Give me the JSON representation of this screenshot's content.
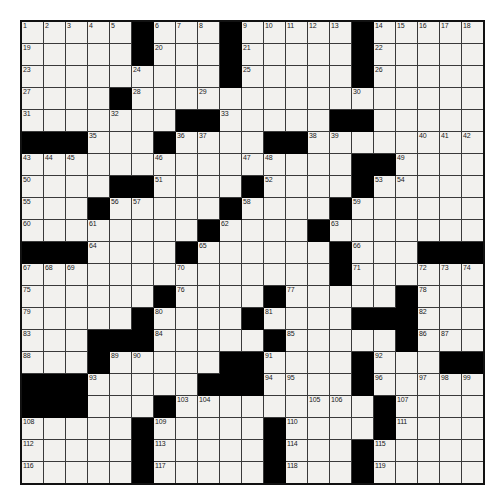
{
  "puzzle": {
    "type": "crossword-grid",
    "rows": 21,
    "cols": 21,
    "colors": {
      "background": "#ffffff",
      "cell_fill": "#f2f1ee",
      "block_fill": "#000000",
      "grid_line": "#3a3a3a",
      "border": "#111111",
      "number_text": "#1a1a1a"
    },
    "max_clue_number": 119,
    "grid": [
      "OOOOO.OOO.OOOOO.OOOOO",
      "OOOOO.OOO.OOOOO.OOOOO",
      "OOOOOOOOO.OOOOO.OOOOO",
      "OOOO.OOOOOOOOOOOOOOOO",
      "OOOOOOO..OOOOO..OOOOO",
      "...OOO.OOOO..OOOOOOOO",
      "OOOOOOOOOOOOOOO..OOOO",
      "OOOO..OOOO.OOOO.OOOOO",
      "OOO.OOOOO.OOOO.OOOOOO",
      "OOOOOOOO.OOOO.OOOOOOO",
      "...OOOO.OOOOOO.OOO...",
      "OOOOOOOOOOOOOO.OOOOOO",
      "OOOOOO.OOOO.OOOOO.OOO",
      "OOOOO.OOOO.OOOO...OOO",
      "OOO...OOOOO.OOOOO.OOO",
      "OOO.OOOOO..OOOO.OOO..",
      "...OOOOO...OOOO.OOOOO",
      "...OOO.OOOOOOOOO.OOOO",
      "OOOOO.OOOOO.OOOO.OOOO",
      "OOOOO.OOOOO.OOO.OOOOO",
      "OOOOO.OOOOO.OOO.OOOOO"
    ],
    "numbers": {
      "r0": [
        {
          "col": 0,
          "n": "1"
        },
        {
          "col": 1,
          "n": "2"
        },
        {
          "col": 2,
          "n": "3"
        },
        {
          "col": 3,
          "n": "4"
        },
        {
          "col": 4,
          "n": "5"
        },
        {
          "col": 6,
          "n": "6"
        },
        {
          "col": 7,
          "n": "7"
        },
        {
          "col": 8,
          "n": "8"
        },
        {
          "col": 10,
          "n": "9"
        },
        {
          "col": 11,
          "n": "10"
        },
        {
          "col": 12,
          "n": "11"
        },
        {
          "col": 13,
          "n": "12"
        },
        {
          "col": 14,
          "n": "13"
        },
        {
          "col": 16,
          "n": "14"
        },
        {
          "col": 17,
          "n": "15"
        },
        {
          "col": 18,
          "n": "16"
        },
        {
          "col": 19,
          "n": "17"
        },
        {
          "col": 20,
          "n": "18"
        }
      ],
      "r1": [
        {
          "col": 0,
          "n": "19"
        },
        {
          "col": 6,
          "n": "20"
        },
        {
          "col": 10,
          "n": "21"
        },
        {
          "col": 16,
          "n": "22"
        }
      ],
      "r2": [
        {
          "col": 0,
          "n": "23"
        },
        {
          "col": 5,
          "n": "24"
        },
        {
          "col": 10,
          "n": "25"
        },
        {
          "col": 16,
          "n": "26"
        }
      ],
      "r3": [
        {
          "col": 0,
          "n": "27"
        },
        {
          "col": 5,
          "n": "28"
        },
        {
          "col": 8,
          "n": "29"
        },
        {
          "col": 15,
          "n": "30"
        }
      ],
      "r4": [
        {
          "col": 0,
          "n": "31"
        },
        {
          "col": 4,
          "n": "32"
        },
        {
          "col": 9,
          "n": "33"
        },
        {
          "col": 15,
          "n": "34"
        }
      ],
      "r5": [
        {
          "col": 3,
          "n": "35"
        },
        {
          "col": 7,
          "n": "36"
        },
        {
          "col": 8,
          "n": "37"
        },
        {
          "col": 13,
          "n": "38"
        },
        {
          "col": 14,
          "n": "39"
        },
        {
          "col": 18,
          "n": "40"
        },
        {
          "col": 19,
          "n": "41"
        },
        {
          "col": 20,
          "n": "42"
        }
      ],
      "r6": [
        {
          "col": 0,
          "n": "43"
        },
        {
          "col": 1,
          "n": "44"
        },
        {
          "col": 2,
          "n": "45"
        },
        {
          "col": 6,
          "n": "46"
        },
        {
          "col": 10,
          "n": "47"
        },
        {
          "col": 11,
          "n": "48"
        },
        {
          "col": 17,
          "n": "49"
        }
      ],
      "r7": [
        {
          "col": 0,
          "n": "50"
        },
        {
          "col": 6,
          "n": "51"
        },
        {
          "col": 11,
          "n": "52"
        },
        {
          "col": 16,
          "n": "53"
        },
        {
          "col": 17,
          "n": "54"
        }
      ],
      "r8": [
        {
          "col": 0,
          "n": "55"
        },
        {
          "col": 4,
          "n": "56"
        },
        {
          "col": 5,
          "n": "57"
        },
        {
          "col": 10,
          "n": "58"
        },
        {
          "col": 15,
          "n": "59"
        }
      ],
      "r9": [
        {
          "col": 0,
          "n": "60"
        },
        {
          "col": 3,
          "n": "61"
        },
        {
          "col": 9,
          "n": "62"
        },
        {
          "col": 14,
          "n": "63"
        }
      ],
      "r10": [
        {
          "col": 3,
          "n": "64"
        },
        {
          "col": 8,
          "n": "65"
        },
        {
          "col": 15,
          "n": "66"
        }
      ],
      "r11": [
        {
          "col": 0,
          "n": "67"
        },
        {
          "col": 1,
          "n": "68"
        },
        {
          "col": 2,
          "n": "69"
        },
        {
          "col": 7,
          "n": "70"
        },
        {
          "col": 15,
          "n": "71"
        },
        {
          "col": 18,
          "n": "72"
        },
        {
          "col": 19,
          "n": "73"
        },
        {
          "col": 20,
          "n": "74"
        }
      ],
      "r12": [
        {
          "col": 0,
          "n": "75"
        },
        {
          "col": 7,
          "n": "76"
        },
        {
          "col": 12,
          "n": "77"
        },
        {
          "col": 18,
          "n": "78"
        }
      ],
      "r13": [
        {
          "col": 0,
          "n": "79"
        },
        {
          "col": 6,
          "n": "80"
        },
        {
          "col": 11,
          "n": "81"
        },
        {
          "col": 18,
          "n": "82"
        }
      ],
      "r14": [
        {
          "col": 0,
          "n": "83"
        },
        {
          "col": 6,
          "n": "84"
        },
        {
          "col": 12,
          "n": "85"
        },
        {
          "col": 18,
          "n": "86"
        },
        {
          "col": 19,
          "n": "87"
        }
      ],
      "r15": [
        {
          "col": 0,
          "n": "88"
        },
        {
          "col": 4,
          "n": "89"
        },
        {
          "col": 5,
          "n": "90"
        },
        {
          "col": 11,
          "n": "91"
        },
        {
          "col": 16,
          "n": "92"
        }
      ],
      "r16": [
        {
          "col": 3,
          "n": "93"
        },
        {
          "col": 11,
          "n": "94"
        },
        {
          "col": 12,
          "n": "95"
        },
        {
          "col": 16,
          "n": "96"
        },
        {
          "col": 18,
          "n": "97"
        },
        {
          "col": 19,
          "n": "98"
        },
        {
          "col": 20,
          "n": "99"
        }
      ],
      "r17": [
        {
          "col": 0,
          "n": "100"
        },
        {
          "col": 1,
          "n": "101"
        },
        {
          "col": 2,
          "n": "102"
        },
        {
          "col": 7,
          "n": "103"
        },
        {
          "col": 8,
          "n": "104"
        },
        {
          "col": 13,
          "n": "105"
        },
        {
          "col": 14,
          "n": "106"
        },
        {
          "col": 17,
          "n": "107"
        }
      ],
      "r18": [
        {
          "col": 0,
          "n": "108"
        },
        {
          "col": 6,
          "n": "109"
        },
        {
          "col": 12,
          "n": "110"
        },
        {
          "col": 17,
          "n": "111"
        }
      ],
      "r19": [
        {
          "col": 0,
          "n": "112"
        },
        {
          "col": 6,
          "n": "113"
        },
        {
          "col": 12,
          "n": "114"
        },
        {
          "col": 16,
          "n": "115"
        }
      ],
      "r20": [
        {
          "col": 0,
          "n": "116"
        },
        {
          "col": 6,
          "n": "117"
        },
        {
          "col": 12,
          "n": "118"
        },
        {
          "col": 16,
          "n": "119"
        }
      ]
    }
  }
}
